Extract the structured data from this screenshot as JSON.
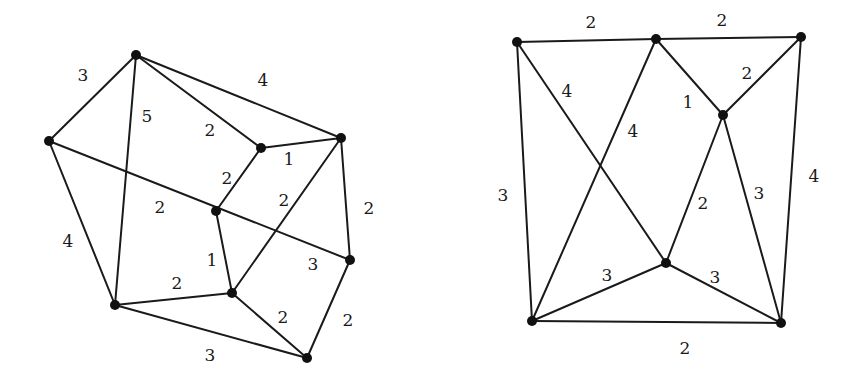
{
  "graphs": [
    {
      "name": "left-graph",
      "nodes": [
        {
          "id": "a",
          "x": 136,
          "y": 55
        },
        {
          "id": "b",
          "x": 49,
          "y": 141
        },
        {
          "id": "c",
          "x": 261,
          "y": 148
        },
        {
          "id": "d",
          "x": 341,
          "y": 138
        },
        {
          "id": "e",
          "x": 216,
          "y": 211
        },
        {
          "id": "f",
          "x": 350,
          "y": 260
        },
        {
          "id": "g",
          "x": 232,
          "y": 293
        },
        {
          "id": "h",
          "x": 115,
          "y": 305
        },
        {
          "id": "i",
          "x": 307,
          "y": 358
        }
      ],
      "edges": [
        {
          "from": "a",
          "to": "b",
          "weight": "3",
          "lx": 83,
          "ly": 75
        },
        {
          "from": "a",
          "to": "d",
          "weight": "4",
          "lx": 263,
          "ly": 80
        },
        {
          "from": "a",
          "to": "h",
          "weight": "5",
          "lx": 147,
          "ly": 116
        },
        {
          "from": "a",
          "to": "c",
          "weight": "2",
          "lx": 210,
          "ly": 130
        },
        {
          "from": "c",
          "to": "d",
          "weight": "1",
          "lx": 289,
          "ly": 159
        },
        {
          "from": "c",
          "to": "e",
          "weight": "2",
          "lx": 227,
          "ly": 178
        },
        {
          "from": "b",
          "to": "f",
          "weight": "2",
          "lx": 160,
          "ly": 207
        },
        {
          "from": "d",
          "to": "g",
          "weight": "2",
          "lx": 284,
          "ly": 200
        },
        {
          "from": "d",
          "to": "f",
          "weight": "2",
          "lx": 369,
          "ly": 208
        },
        {
          "from": "b",
          "to": "h",
          "weight": "4",
          "lx": 68,
          "ly": 241
        },
        {
          "from": "e",
          "to": "g",
          "weight": "1",
          "lx": 212,
          "ly": 260
        },
        {
          "from": "h",
          "to": "g",
          "weight": "2",
          "lx": 177,
          "ly": 283
        },
        {
          "from": "g",
          "to": "i",
          "weight": "2",
          "lx": 283,
          "ly": 317
        },
        {
          "from": "f",
          "to": "i",
          "weight": "2",
          "lx": 348,
          "ly": 320
        },
        {
          "from": "h",
          "to": "i",
          "weight": "3",
          "lx": 210,
          "ly": 355
        }
      ],
      "extra_labels": [
        {
          "text": "3",
          "x": 313,
          "y": 264
        }
      ]
    },
    {
      "name": "right-graph",
      "nodes": [
        {
          "id": "p",
          "x": 517,
          "y": 42
        },
        {
          "id": "q",
          "x": 656,
          "y": 39
        },
        {
          "id": "r",
          "x": 801,
          "y": 37
        },
        {
          "id": "s",
          "x": 723,
          "y": 115
        },
        {
          "id": "t",
          "x": 666,
          "y": 263
        },
        {
          "id": "u",
          "x": 532,
          "y": 321
        },
        {
          "id": "v",
          "x": 781,
          "y": 323
        }
      ],
      "edges": [
        {
          "from": "p",
          "to": "q",
          "weight": "2",
          "lx": 591,
          "ly": 22
        },
        {
          "from": "q",
          "to": "r",
          "weight": "2",
          "lx": 722,
          "ly": 20
        },
        {
          "from": "r",
          "to": "s",
          "weight": "2",
          "lx": 747,
          "ly": 73
        },
        {
          "from": "q",
          "to": "s",
          "weight": "1",
          "lx": 688,
          "ly": 102
        },
        {
          "from": "p",
          "to": "t",
          "weight": "4",
          "lx": 567,
          "ly": 91
        },
        {
          "from": "q",
          "to": "u",
          "weight": "4",
          "lx": 633,
          "ly": 131
        },
        {
          "from": "p",
          "to": "u",
          "weight": "3",
          "lx": 503,
          "ly": 195
        },
        {
          "from": "s",
          "to": "t",
          "weight": "2",
          "lx": 703,
          "ly": 203
        },
        {
          "from": "s",
          "to": "v",
          "weight": "3",
          "lx": 759,
          "ly": 193
        },
        {
          "from": "r",
          "to": "v",
          "weight": "4",
          "lx": 814,
          "ly": 176
        },
        {
          "from": "u",
          "to": "t",
          "weight": "3",
          "lx": 607,
          "ly": 275
        },
        {
          "from": "t",
          "to": "v",
          "weight": "3",
          "lx": 715,
          "ly": 277
        },
        {
          "from": "u",
          "to": "v",
          "weight": "2",
          "lx": 685,
          "ly": 348
        }
      ],
      "extra_labels": []
    }
  ]
}
